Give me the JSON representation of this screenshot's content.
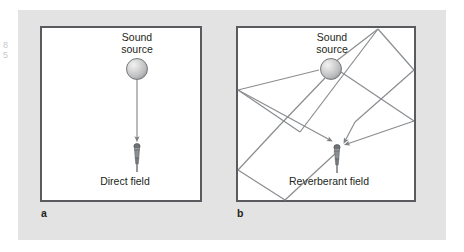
{
  "figure": {
    "background_color": "#e3e3e3",
    "room_border_color": "#595b5e",
    "ray_color": "#8a8d90",
    "text_color": "#231f20",
    "margin_glyph": "8 5"
  },
  "panels": [
    {
      "id": "a",
      "letter": "a",
      "source_label": "Sound\nsource",
      "field_label": "Direct field",
      "source_icon": "sound-source-sphere",
      "receiver_icon": "microphone",
      "ray_count": 1,
      "ray_type": "direct"
    },
    {
      "id": "b",
      "letter": "b",
      "source_label": "Sound\nsource",
      "field_label": "Reverberant field",
      "source_icon": "sound-source-sphere",
      "receiver_icon": "microphone",
      "ray_count": 4,
      "ray_type": "reflected"
    }
  ]
}
